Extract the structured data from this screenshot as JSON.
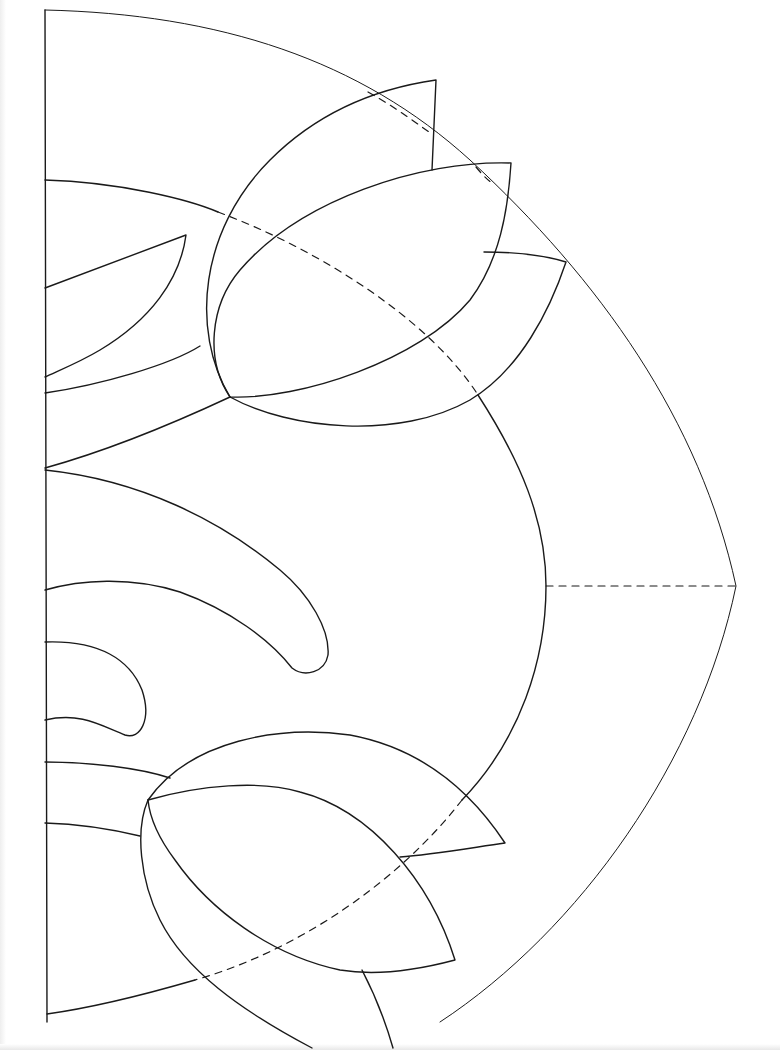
{
  "figure": {
    "kind": "applique quilt block pattern (half-block template)",
    "stroke_color": "#1a1a1a",
    "background": "#ffffff"
  },
  "shapes": {
    "center_fold_line": "M45 10 L47 1022",
    "outer_arc": "M45 10 C220 14 360 60 470 160 C600 280 700 420 736 586 C700 760 580 930 440 1022",
    "inner_arc_top": "M45 180 C120 182 190 200 218 212",
    "inner_arc_top_dashed": "M218 212 C320 250 430 320 478 395",
    "inner_arc_mid": "M478 395 C520 460 546 520 546 586 C546 660 520 740 462 800",
    "inner_arc_low_dashed": "M462 800 C400 880 300 950 195 980",
    "inner_arc_bottom": "M195 980 C140 996 90 1008 47 1014",
    "radial_dashed": "M546 586 L736 586",
    "top_tulip_outer_petal": "M230 397 C190 330 200 230 270 160 C320 110 380 88 436 80 L432 170",
    "top_tulip_center_petal": "M230 397 C300 400 420 360 470 300 C500 260 508 210 511 163 C420 160 300 200 240 270 C210 305 205 360 230 397",
    "top_tulip_right_petal": "M230 397 C290 430 400 440 470 400 C520 370 550 310 566 262 C540 254 510 252 484 252",
    "top_tulip_outer_dashed": "M368 92 C400 110 420 126 432 134",
    "top_tulip_right_dashed": "M476 167 C485 178 490 182 494 184",
    "top_left_leaf": "M45 288 L186 235 C180 280 150 320 100 350 C80 362 60 370 45 377",
    "top_stem_upper": "M45 393 C100 385 170 365 200 346",
    "top_stem_lower": "M45 468 C110 450 170 425 230 397",
    "middle_long_leaf": "M45 470 C140 480 220 520 280 570 C310 595 330 630 328 655 C325 672 305 678 292 668 C270 640 230 610 180 592 C130 576 80 580 45 590",
    "middle_short_leaf": "M45 642 C100 640 130 660 142 690 C152 720 140 740 125 735 C100 725 80 712 45 720",
    "bottom_tulip_outer_petal": "M148 800 C190 740 280 725 350 735 C420 748 470 790 505 843 C470 848 430 855 400 857",
    "bottom_tulip_center_petal": "M148 800 C200 785 260 780 300 792 C370 810 430 880 455 960 C410 972 370 975 340 970 C270 955 210 910 175 860 C160 840 150 820 148 800",
    "bottom_tulip_left_petal": "M148 800 C135 830 140 880 160 920 C185 970 240 1010 312 1048",
    "bottom_stem_upper": "M45 762 C90 762 140 768 170 778",
    "bottom_stem_lower": "M45 823 C80 824 115 830 140 836",
    "bottom_right_curve": "M362 970 C375 995 385 1020 393 1048"
  }
}
